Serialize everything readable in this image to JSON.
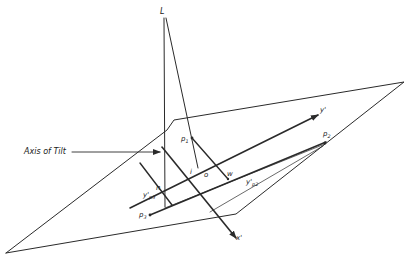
{
  "diagram": {
    "labels": {
      "L": "L",
      "axis_of_tilt": "Axis of Tilt",
      "p1_base": "p",
      "p1_sub": "1",
      "p2_base": "p",
      "p2_sub": "2",
      "p3_base": "p",
      "p3_sub": "3",
      "y_prime": "y'",
      "x_prime": "x'",
      "i": "i",
      "o": "o",
      "n": "n",
      "w": "w",
      "yp2_base": "y'",
      "yp2_sub": "p2",
      "yp3_base": "y'",
      "yp3_sub": "p3"
    },
    "colors": {
      "line": "#2a2a2a",
      "background": "#ffffff"
    }
  }
}
